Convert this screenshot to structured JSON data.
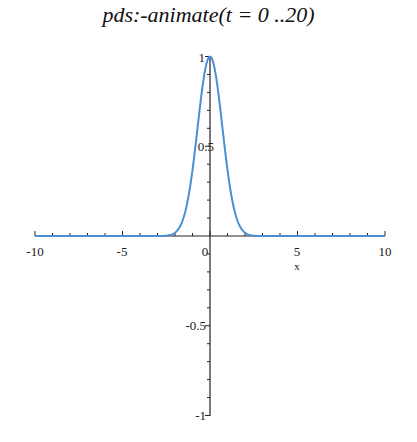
{
  "chart_data": {
    "type": "line",
    "title": "pds:-animate(t = 0 ..20)",
    "xlabel": "x",
    "ylabel": "",
    "xlim": [
      -10,
      10
    ],
    "ylim": [
      -1,
      1
    ],
    "x_ticks": [
      "-10",
      "-5",
      "0",
      "5",
      "10"
    ],
    "y_ticks": [
      "-1",
      "-0.5",
      "0.5",
      "1"
    ],
    "grid": false,
    "legend": null,
    "series": [
      {
        "name": "u(x,t)",
        "color": "#4a8fd6",
        "x": [
          -10,
          -3,
          -2.5,
          -2,
          -1.5,
          -1.25,
          -1,
          -0.75,
          -0.5,
          -0.25,
          0,
          0.25,
          0.5,
          0.75,
          1,
          1.25,
          1.5,
          2,
          2.5,
          3,
          10
        ],
        "y": [
          0,
          0.0001,
          0.0019,
          0.0183,
          0.1054,
          0.2096,
          0.3679,
          0.5698,
          0.7788,
          0.9394,
          1.0,
          0.9394,
          0.7788,
          0.5698,
          0.3679,
          0.2096,
          0.1054,
          0.0183,
          0.0019,
          0.0001,
          0
        ]
      }
    ]
  },
  "labels": {
    "title": "pds:-animate(t = 0 ..20)",
    "xlabel": "x",
    "xt_m10": "-10",
    "xt_m5": "-5",
    "xt_0": "0",
    "xt_5": "5",
    "xt_10": "10",
    "yt_1": "1",
    "yt_05": "0.5",
    "yt_m05": "-0.5",
    "yt_m1": "-1"
  }
}
